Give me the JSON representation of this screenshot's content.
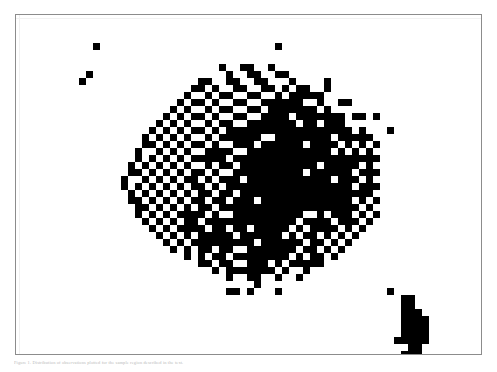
{
  "figure": {
    "name": "scatter-figure",
    "background_color": "#ffffff",
    "frame_color": "#8c8c8c",
    "point_color": "#000000",
    "caption": "Figure 1.  Distribution of observations plotted for the sample region described in the text."
  },
  "chart_data": {
    "type": "scatter",
    "title": "",
    "xlabel": "",
    "ylabel": "",
    "grid": false,
    "legend": null,
    "xlim": [
      0,
      67
    ],
    "ylim": [
      0,
      49
    ],
    "marker": "filled-square",
    "marker_size_px": 7,
    "point_color": "#000000",
    "background_color": "#ffffff",
    "note": "Binary dithered density scatter; coordinates are integer grid cells (col,row) from the plot frame origin at top-left.",
    "n_points": 716,
    "clusters": [
      {
        "name": "outlier-upper-left",
        "n_points": 3
      },
      {
        "name": "outlier-upper-center",
        "n_points": 1
      },
      {
        "name": "main-cloud",
        "n_points": 690
      },
      {
        "name": "lower-right-cluster",
        "n_points": 22
      }
    ],
    "points": [
      [
        11,
        4
      ],
      [
        10,
        8
      ],
      [
        9,
        9
      ],
      [
        37,
        4
      ],
      [
        29,
        7
      ],
      [
        32,
        7
      ],
      [
        33,
        7
      ],
      [
        36,
        7
      ],
      [
        30,
        8
      ],
      [
        33,
        8
      ],
      [
        34,
        8
      ],
      [
        37,
        8
      ],
      [
        38,
        8
      ],
      [
        26,
        9
      ],
      [
        27,
        9
      ],
      [
        30,
        9
      ],
      [
        31,
        9
      ],
      [
        34,
        9
      ],
      [
        35,
        9
      ],
      [
        39,
        9
      ],
      [
        25,
        10
      ],
      [
        26,
        10
      ],
      [
        28,
        10
      ],
      [
        31,
        10
      ],
      [
        32,
        10
      ],
      [
        35,
        10
      ],
      [
        36,
        10
      ],
      [
        38,
        10
      ],
      [
        40,
        10
      ],
      [
        41,
        10
      ],
      [
        24,
        11
      ],
      [
        27,
        11
      ],
      [
        29,
        11
      ],
      [
        30,
        11
      ],
      [
        33,
        11
      ],
      [
        34,
        11
      ],
      [
        37,
        11
      ],
      [
        39,
        11
      ],
      [
        41,
        11
      ],
      [
        42,
        11
      ],
      [
        23,
        12
      ],
      [
        25,
        12
      ],
      [
        26,
        12
      ],
      [
        28,
        12
      ],
      [
        31,
        12
      ],
      [
        32,
        12
      ],
      [
        35,
        12
      ],
      [
        36,
        12
      ],
      [
        38,
        12
      ],
      [
        40,
        12
      ],
      [
        43,
        12
      ],
      [
        22,
        13
      ],
      [
        24,
        13
      ],
      [
        27,
        13
      ],
      [
        29,
        13
      ],
      [
        30,
        13
      ],
      [
        33,
        13
      ],
      [
        34,
        13
      ],
      [
        37,
        13
      ],
      [
        39,
        13
      ],
      [
        41,
        13
      ],
      [
        42,
        13
      ],
      [
        44,
        13
      ],
      [
        21,
        14
      ],
      [
        23,
        14
      ],
      [
        25,
        14
      ],
      [
        26,
        14
      ],
      [
        28,
        14
      ],
      [
        31,
        14
      ],
      [
        32,
        14
      ],
      [
        35,
        14
      ],
      [
        36,
        14
      ],
      [
        38,
        14
      ],
      [
        40,
        14
      ],
      [
        43,
        14
      ],
      [
        45,
        14
      ],
      [
        20,
        15
      ],
      [
        22,
        15
      ],
      [
        24,
        15
      ],
      [
        27,
        15
      ],
      [
        29,
        15
      ],
      [
        30,
        15
      ],
      [
        33,
        15
      ],
      [
        34,
        15
      ],
      [
        37,
        15
      ],
      [
        39,
        15
      ],
      [
        41,
        15
      ],
      [
        42,
        15
      ],
      [
        44,
        15
      ],
      [
        46,
        15
      ],
      [
        19,
        16
      ],
      [
        21,
        16
      ],
      [
        23,
        16
      ],
      [
        25,
        16
      ],
      [
        26,
        16
      ],
      [
        28,
        16
      ],
      [
        31,
        16
      ],
      [
        32,
        16
      ],
      [
        35,
        16
      ],
      [
        36,
        16
      ],
      [
        38,
        16
      ],
      [
        40,
        16
      ],
      [
        43,
        16
      ],
      [
        45,
        16
      ],
      [
        47,
        16
      ],
      [
        18,
        17
      ],
      [
        20,
        17
      ],
      [
        22,
        17
      ],
      [
        24,
        17
      ],
      [
        27,
        17
      ],
      [
        29,
        17
      ],
      [
        30,
        17
      ],
      [
        33,
        17
      ],
      [
        34,
        17
      ],
      [
        37,
        17
      ],
      [
        39,
        17
      ],
      [
        41,
        17
      ],
      [
        42,
        17
      ],
      [
        44,
        17
      ],
      [
        46,
        17
      ],
      [
        48,
        17
      ],
      [
        18,
        18
      ],
      [
        19,
        18
      ],
      [
        21,
        18
      ],
      [
        23,
        18
      ],
      [
        25,
        18
      ],
      [
        26,
        18
      ],
      [
        28,
        18
      ],
      [
        31,
        18
      ],
      [
        32,
        18
      ],
      [
        35,
        18
      ],
      [
        36,
        18
      ],
      [
        38,
        18
      ],
      [
        40,
        18
      ],
      [
        43,
        18
      ],
      [
        45,
        18
      ],
      [
        47,
        18
      ],
      [
        49,
        18
      ],
      [
        17,
        19
      ],
      [
        20,
        19
      ],
      [
        22,
        19
      ],
      [
        24,
        19
      ],
      [
        27,
        19
      ],
      [
        29,
        19
      ],
      [
        30,
        19
      ],
      [
        33,
        19
      ],
      [
        34,
        19
      ],
      [
        37,
        19
      ],
      [
        39,
        19
      ],
      [
        41,
        19
      ],
      [
        42,
        19
      ],
      [
        44,
        19
      ],
      [
        46,
        19
      ],
      [
        48,
        19
      ],
      [
        50,
        19
      ],
      [
        17,
        20
      ],
      [
        19,
        20
      ],
      [
        21,
        20
      ],
      [
        23,
        20
      ],
      [
        25,
        20
      ],
      [
        26,
        20
      ],
      [
        28,
        20
      ],
      [
        31,
        20
      ],
      [
        32,
        20
      ],
      [
        35,
        20
      ],
      [
        36,
        20
      ],
      [
        38,
        20
      ],
      [
        40,
        20
      ],
      [
        43,
        20
      ],
      [
        45,
        20
      ],
      [
        47,
        20
      ],
      [
        49,
        20
      ],
      [
        51,
        20
      ],
      [
        16,
        21
      ],
      [
        18,
        21
      ],
      [
        20,
        21
      ],
      [
        22,
        21
      ],
      [
        24,
        21
      ],
      [
        27,
        21
      ],
      [
        29,
        21
      ],
      [
        30,
        21
      ],
      [
        33,
        21
      ],
      [
        34,
        21
      ],
      [
        37,
        21
      ],
      [
        39,
        21
      ],
      [
        41,
        21
      ],
      [
        42,
        21
      ],
      [
        44,
        21
      ],
      [
        46,
        21
      ],
      [
        48,
        21
      ],
      [
        50,
        21
      ],
      [
        16,
        22
      ],
      [
        17,
        22
      ],
      [
        19,
        22
      ],
      [
        21,
        22
      ],
      [
        23,
        22
      ],
      [
        25,
        22
      ],
      [
        26,
        22
      ],
      [
        28,
        22
      ],
      [
        31,
        22
      ],
      [
        32,
        22
      ],
      [
        35,
        22
      ],
      [
        36,
        22
      ],
      [
        38,
        22
      ],
      [
        40,
        22
      ],
      [
        43,
        22
      ],
      [
        45,
        22
      ],
      [
        47,
        22
      ],
      [
        49,
        22
      ],
      [
        51,
        22
      ],
      [
        15,
        23
      ],
      [
        18,
        23
      ],
      [
        20,
        23
      ],
      [
        22,
        23
      ],
      [
        24,
        23
      ],
      [
        27,
        23
      ],
      [
        29,
        23
      ],
      [
        30,
        23
      ],
      [
        33,
        23
      ],
      [
        34,
        23
      ],
      [
        37,
        23
      ],
      [
        39,
        23
      ],
      [
        41,
        23
      ],
      [
        42,
        23
      ],
      [
        44,
        23
      ],
      [
        46,
        23
      ],
      [
        48,
        23
      ],
      [
        50,
        23
      ],
      [
        15,
        24
      ],
      [
        17,
        24
      ],
      [
        19,
        24
      ],
      [
        21,
        24
      ],
      [
        23,
        24
      ],
      [
        25,
        24
      ],
      [
        26,
        24
      ],
      [
        28,
        24
      ],
      [
        31,
        24
      ],
      [
        32,
        24
      ],
      [
        35,
        24
      ],
      [
        36,
        24
      ],
      [
        38,
        24
      ],
      [
        40,
        24
      ],
      [
        43,
        24
      ],
      [
        45,
        24
      ],
      [
        47,
        24
      ],
      [
        49,
        24
      ],
      [
        51,
        24
      ],
      [
        16,
        25
      ],
      [
        18,
        25
      ],
      [
        20,
        25
      ],
      [
        22,
        25
      ],
      [
        24,
        25
      ],
      [
        27,
        25
      ],
      [
        29,
        25
      ],
      [
        30,
        25
      ],
      [
        33,
        25
      ],
      [
        34,
        25
      ],
      [
        37,
        25
      ],
      [
        39,
        25
      ],
      [
        41,
        25
      ],
      [
        42,
        25
      ],
      [
        44,
        25
      ],
      [
        46,
        25
      ],
      [
        48,
        25
      ],
      [
        50,
        25
      ],
      [
        16,
        26
      ],
      [
        17,
        26
      ],
      [
        19,
        26
      ],
      [
        21,
        26
      ],
      [
        23,
        26
      ],
      [
        25,
        26
      ],
      [
        26,
        26
      ],
      [
        28,
        26
      ],
      [
        31,
        26
      ],
      [
        32,
        26
      ],
      [
        35,
        26
      ],
      [
        36,
        26
      ],
      [
        38,
        26
      ],
      [
        40,
        26
      ],
      [
        43,
        26
      ],
      [
        45,
        26
      ],
      [
        47,
        26
      ],
      [
        49,
        26
      ],
      [
        51,
        26
      ],
      [
        17,
        27
      ],
      [
        18,
        27
      ],
      [
        20,
        27
      ],
      [
        22,
        27
      ],
      [
        24,
        27
      ],
      [
        27,
        27
      ],
      [
        29,
        27
      ],
      [
        30,
        27
      ],
      [
        33,
        27
      ],
      [
        34,
        27
      ],
      [
        37,
        27
      ],
      [
        39,
        27
      ],
      [
        41,
        27
      ],
      [
        42,
        27
      ],
      [
        44,
        27
      ],
      [
        46,
        27
      ],
      [
        48,
        27
      ],
      [
        50,
        27
      ],
      [
        17,
        28
      ],
      [
        19,
        28
      ],
      [
        21,
        28
      ],
      [
        23,
        28
      ],
      [
        25,
        28
      ],
      [
        26,
        28
      ],
      [
        28,
        28
      ],
      [
        31,
        28
      ],
      [
        32,
        28
      ],
      [
        35,
        28
      ],
      [
        36,
        28
      ],
      [
        38,
        28
      ],
      [
        40,
        28
      ],
      [
        43,
        28
      ],
      [
        45,
        28
      ],
      [
        47,
        28
      ],
      [
        49,
        28
      ],
      [
        51,
        28
      ],
      [
        18,
        29
      ],
      [
        20,
        29
      ],
      [
        22,
        29
      ],
      [
        24,
        29
      ],
      [
        27,
        29
      ],
      [
        29,
        29
      ],
      [
        30,
        29
      ],
      [
        33,
        29
      ],
      [
        34,
        29
      ],
      [
        37,
        29
      ],
      [
        39,
        29
      ],
      [
        41,
        29
      ],
      [
        42,
        29
      ],
      [
        44,
        29
      ],
      [
        46,
        29
      ],
      [
        48,
        29
      ],
      [
        50,
        29
      ],
      [
        19,
        30
      ],
      [
        21,
        30
      ],
      [
        23,
        30
      ],
      [
        25,
        30
      ],
      [
        26,
        30
      ],
      [
        28,
        30
      ],
      [
        31,
        30
      ],
      [
        32,
        30
      ],
      [
        35,
        30
      ],
      [
        36,
        30
      ],
      [
        38,
        30
      ],
      [
        40,
        30
      ],
      [
        43,
        30
      ],
      [
        45,
        30
      ],
      [
        47,
        30
      ],
      [
        49,
        30
      ],
      [
        20,
        31
      ],
      [
        22,
        31
      ],
      [
        24,
        31
      ],
      [
        27,
        31
      ],
      [
        29,
        31
      ],
      [
        30,
        31
      ],
      [
        33,
        31
      ],
      [
        34,
        31
      ],
      [
        37,
        31
      ],
      [
        39,
        31
      ],
      [
        41,
        31
      ],
      [
        42,
        31
      ],
      [
        44,
        31
      ],
      [
        46,
        31
      ],
      [
        48,
        31
      ],
      [
        21,
        32
      ],
      [
        23,
        32
      ],
      [
        25,
        32
      ],
      [
        26,
        32
      ],
      [
        28,
        32
      ],
      [
        31,
        32
      ],
      [
        32,
        32
      ],
      [
        35,
        32
      ],
      [
        36,
        32
      ],
      [
        38,
        32
      ],
      [
        40,
        32
      ],
      [
        43,
        32
      ],
      [
        45,
        32
      ],
      [
        47,
        32
      ],
      [
        22,
        33
      ],
      [
        24,
        33
      ],
      [
        27,
        33
      ],
      [
        29,
        33
      ],
      [
        30,
        33
      ],
      [
        33,
        33
      ],
      [
        34,
        33
      ],
      [
        37,
        33
      ],
      [
        39,
        33
      ],
      [
        41,
        33
      ],
      [
        42,
        33
      ],
      [
        44,
        33
      ],
      [
        46,
        33
      ],
      [
        24,
        34
      ],
      [
        26,
        34
      ],
      [
        28,
        34
      ],
      [
        31,
        34
      ],
      [
        32,
        34
      ],
      [
        35,
        34
      ],
      [
        36,
        34
      ],
      [
        38,
        34
      ],
      [
        40,
        34
      ],
      [
        43,
        34
      ],
      [
        45,
        34
      ],
      [
        26,
        35
      ],
      [
        29,
        35
      ],
      [
        30,
        35
      ],
      [
        33,
        35
      ],
      [
        34,
        35
      ],
      [
        37,
        35
      ],
      [
        39,
        35
      ],
      [
        41,
        35
      ],
      [
        43,
        35
      ],
      [
        28,
        36
      ],
      [
        31,
        36
      ],
      [
        34,
        36
      ],
      [
        36,
        36
      ],
      [
        38,
        36
      ],
      [
        41,
        36
      ],
      [
        30,
        37
      ],
      [
        33,
        37
      ],
      [
        37,
        37
      ],
      [
        40,
        37
      ],
      [
        53,
        39
      ],
      [
        55,
        40
      ],
      [
        56,
        41
      ],
      [
        55,
        42
      ],
      [
        56,
        42
      ],
      [
        55,
        43
      ],
      [
        56,
        43
      ],
      [
        57,
        43
      ],
      [
        55,
        44
      ],
      [
        57,
        44
      ],
      [
        55,
        45
      ],
      [
        56,
        45
      ],
      [
        57,
        45
      ],
      [
        55,
        46
      ],
      [
        56,
        46
      ],
      [
        57,
        46
      ],
      [
        56,
        47
      ],
      [
        57,
        47
      ],
      [
        57,
        48
      ],
      [
        56,
        48
      ],
      [
        55,
        41
      ],
      [
        57,
        42
      ]
    ]
  }
}
